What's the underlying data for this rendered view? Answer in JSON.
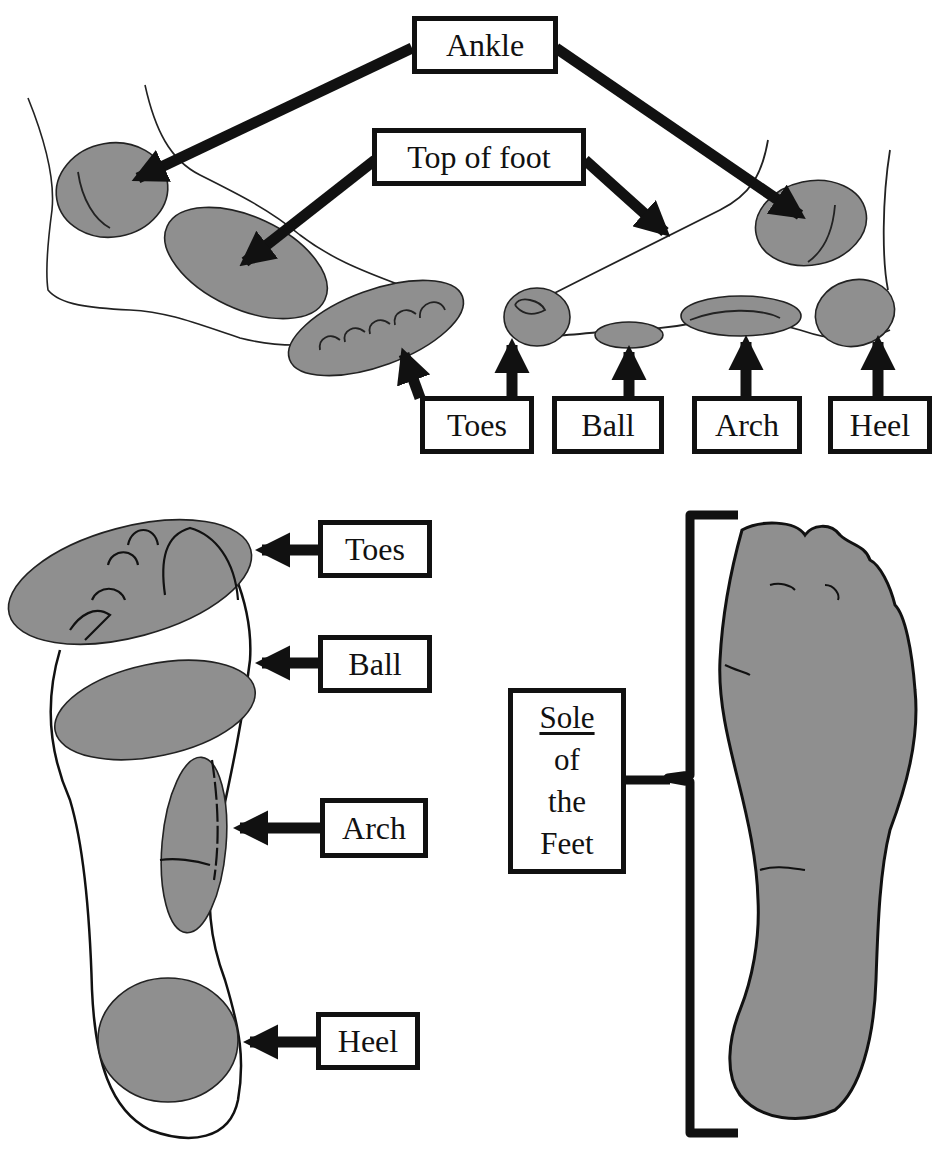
{
  "colors": {
    "fill": "#8f8f8f",
    "stroke": "#111111",
    "background": "#ffffff"
  },
  "top_view": {
    "labels": {
      "ankle": "Ankle",
      "top_of_foot": "Top of foot",
      "toes": "Toes",
      "ball": "Ball",
      "arch": "Arch",
      "heel": "Heel"
    }
  },
  "bottom_view": {
    "labels": {
      "toes": "Toes",
      "ball": "Ball",
      "arch": "Arch",
      "heel": "Heel"
    },
    "sole_label": {
      "line1": "Sole",
      "line2": "of",
      "line3": "the",
      "line4": "Feet"
    }
  }
}
